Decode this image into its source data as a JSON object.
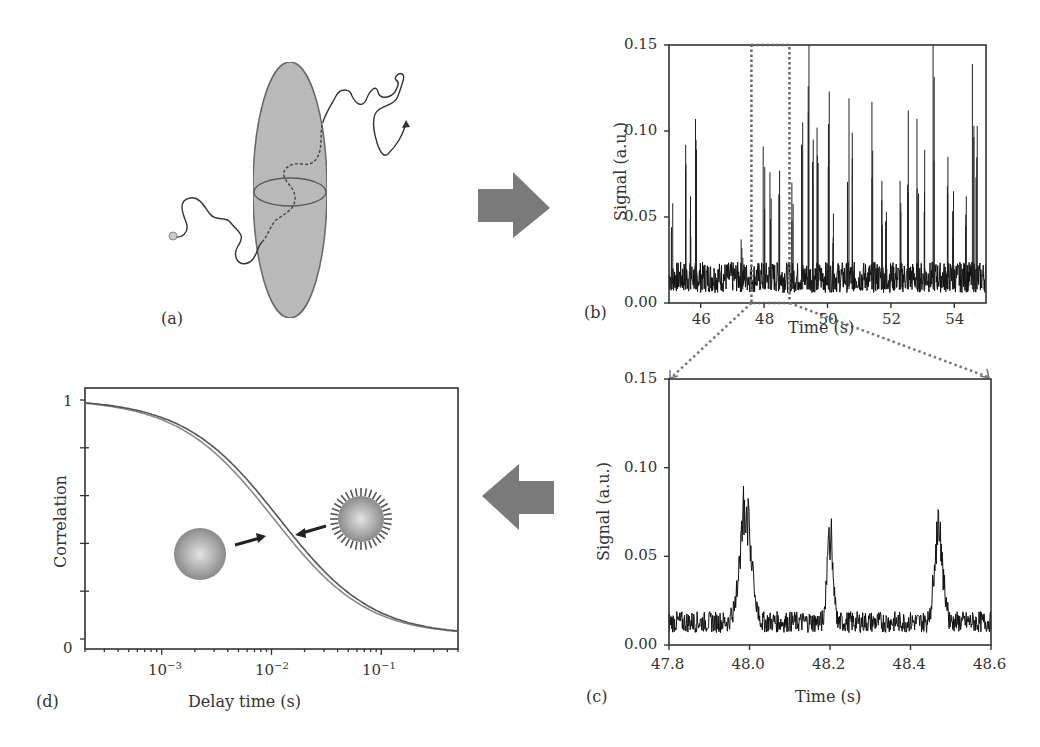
{
  "figure": {
    "arrows": {
      "right_arrow_color": "#7a7a7a",
      "left_arrow_color": "#7a7a7a"
    },
    "panels": {
      "a": {
        "label": "(a)",
        "description": "molecule diffusing through focal volume"
      },
      "b": {
        "label": "(b)"
      },
      "c": {
        "label": "(c)"
      },
      "d": {
        "label": "(d)"
      }
    }
  },
  "chart_data": [
    {
      "id": "b",
      "type": "line",
      "title": "",
      "xlabel": "Time (s)",
      "ylabel": "Signal (a.u.)",
      "xlim": [
        45,
        55
      ],
      "ylim": [
        0,
        0.15
      ],
      "xticks": [
        "46",
        "48",
        "50",
        "52",
        "54"
      ],
      "yticks": [
        "0.00",
        "0.05",
        "0.10",
        "0.15"
      ],
      "baseline": 0.015,
      "grid": false,
      "annotation": "dotted box around 47.6-48.8 s zoomed in panel (c)",
      "zoom_box": [
        47.6,
        48.8
      ],
      "bursts": [
        {
          "x": 45.1,
          "y": 0.058
        },
        {
          "x": 45.55,
          "y": 0.092
        },
        {
          "x": 45.7,
          "y": 0.062
        },
        {
          "x": 45.85,
          "y": 0.107
        },
        {
          "x": 47.3,
          "y": 0.037
        },
        {
          "x": 48.0,
          "y": 0.091
        },
        {
          "x": 48.2,
          "y": 0.076
        },
        {
          "x": 48.48,
          "y": 0.077
        },
        {
          "x": 48.9,
          "y": 0.07
        },
        {
          "x": 49.2,
          "y": 0.105
        },
        {
          "x": 49.4,
          "y": 0.15
        },
        {
          "x": 49.55,
          "y": 0.095
        },
        {
          "x": 49.7,
          "y": 0.102
        },
        {
          "x": 50.05,
          "y": 0.123
        },
        {
          "x": 50.2,
          "y": 0.052
        },
        {
          "x": 50.65,
          "y": 0.119
        },
        {
          "x": 50.8,
          "y": 0.099
        },
        {
          "x": 51.4,
          "y": 0.117
        },
        {
          "x": 51.7,
          "y": 0.071
        },
        {
          "x": 51.85,
          "y": 0.053
        },
        {
          "x": 52.3,
          "y": 0.071
        },
        {
          "x": 52.55,
          "y": 0.112
        },
        {
          "x": 52.85,
          "y": 0.107
        },
        {
          "x": 53.05,
          "y": 0.089
        },
        {
          "x": 53.35,
          "y": 0.15
        },
        {
          "x": 53.8,
          "y": 0.085
        },
        {
          "x": 53.95,
          "y": 0.065
        },
        {
          "x": 54.35,
          "y": 0.062
        },
        {
          "x": 54.6,
          "y": 0.139
        },
        {
          "x": 54.7,
          "y": 0.103
        }
      ]
    },
    {
      "id": "c",
      "type": "line",
      "title": "",
      "xlabel": "Time (s)",
      "ylabel": "Signal (a.u.)",
      "xlim": [
        47.8,
        48.6
      ],
      "ylim": [
        0,
        0.15
      ],
      "xticks": [
        "47.8",
        "48.0",
        "48.2",
        "48.4",
        "48.6"
      ],
      "yticks": [
        "0.00",
        "0.05",
        "0.10",
        "0.15"
      ],
      "baseline": 0.013,
      "grid": false,
      "bursts": [
        {
          "x": 47.99,
          "y": 0.091,
          "width": 0.04
        },
        {
          "x": 48.2,
          "y": 0.076,
          "width": 0.02
        },
        {
          "x": 48.47,
          "y": 0.077,
          "width": 0.03
        }
      ]
    },
    {
      "id": "d",
      "type": "line",
      "title": "",
      "xlabel": "Delay time (s)",
      "ylabel": "Correlation",
      "xscale": "log",
      "xlim": [
        0.0002,
        0.5
      ],
      "ylim": [
        0,
        1
      ],
      "xticks": [
        "10^-3",
        "10^-2",
        "10^-1"
      ],
      "yticks": [
        "0",
        "1"
      ],
      "grid": false,
      "series": [
        {
          "name": "bare particle (faster)",
          "tau_d": 0.0105
        },
        {
          "name": "coated particle (slower)",
          "tau_d": 0.0118
        }
      ],
      "annotations": [
        "bare sphere icon with arrow to left curve",
        "coated sphere icon with arrow to right curve"
      ]
    }
  ],
  "text": {
    "b": {
      "xlabel": "Time (s)",
      "ylabel": "Signal (a.u.)",
      "xticks": [
        "46",
        "48",
        "50",
        "52",
        "54"
      ],
      "yticks": [
        "0.00",
        "0.05",
        "0.10",
        "0.15"
      ],
      "label": "(b)"
    },
    "c": {
      "xlabel": "Time (s)",
      "ylabel": "Signal (a.u.)",
      "xticks": [
        "47.8",
        "48.0",
        "48.2",
        "48.4",
        "48.6"
      ],
      "yticks": [
        "0.00",
        "0.05",
        "0.10",
        "0.15"
      ],
      "label": "(c)"
    },
    "d": {
      "xlabel": "Delay time (s)",
      "ylabel": "Correlation",
      "ytick_top": "1",
      "ytick_bottom": "0",
      "xtick_base": "10",
      "xtick_exps": [
        "−3",
        "−2",
        "−1"
      ],
      "label": "(d)"
    },
    "a": {
      "label": "(a)"
    }
  }
}
